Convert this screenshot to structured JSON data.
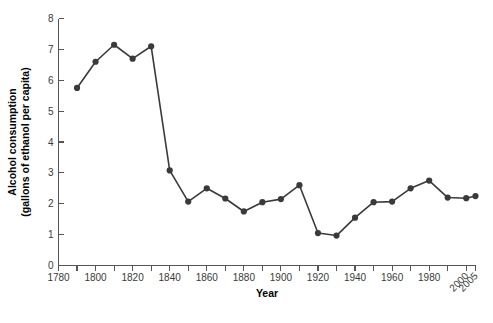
{
  "chart_data": {
    "type": "line",
    "title": "",
    "xlabel": "Year",
    "ylabel": "Alcohol consumption\n(gallons of ethanol per capita)",
    "ylabel_line1": "Alcohol consumption",
    "ylabel_line2": "(gallons of ethanol per capita)",
    "xlim": [
      1780,
      2005
    ],
    "ylim": [
      0,
      8
    ],
    "grid": false,
    "legend": "none",
    "series_color": "#3a3a3a",
    "axis_color": "#555555",
    "x_tick_labels": [
      "1780",
      "1800",
      "1820",
      "1840",
      "1860",
      "1880",
      "1900",
      "1920",
      "1940",
      "1960",
      "1980",
      "2000",
      "2005"
    ],
    "x_tick_values": [
      1780,
      1800,
      1820,
      1840,
      1860,
      1880,
      1900,
      1920,
      1940,
      1960,
      1980,
      2000,
      2005
    ],
    "x_rotated_labels": [
      "2000",
      "2005"
    ],
    "x_minor_ticks": [
      1790,
      1810,
      1830,
      1850,
      1870,
      1890,
      1910,
      1930,
      1950,
      1970,
      1990
    ],
    "y_tick_labels": [
      "0",
      "1",
      "2",
      "3",
      "4",
      "5",
      "6",
      "7",
      "8"
    ],
    "y_tick_values": [
      0,
      1,
      2,
      3,
      4,
      5,
      6,
      7,
      8
    ],
    "x": [
      1790,
      1800,
      1810,
      1820,
      1830,
      1840,
      1850,
      1860,
      1870,
      1880,
      1890,
      1900,
      1910,
      1920,
      1930,
      1940,
      1950,
      1960,
      1970,
      1980,
      1990,
      2000,
      2005
    ],
    "values": [
      5.75,
      6.6,
      7.15,
      6.7,
      7.1,
      3.08,
      2.07,
      2.5,
      2.17,
      1.75,
      2.05,
      2.15,
      2.6,
      1.05,
      0.97,
      1.55,
      2.05,
      2.07,
      2.5,
      2.75,
      2.2,
      2.18,
      2.25
    ],
    "series": [
      {
        "name": "Alcohol consumption",
        "points": [
          {
            "x": 1790,
            "y": 5.75
          },
          {
            "x": 1800,
            "y": 6.6
          },
          {
            "x": 1810,
            "y": 7.15
          },
          {
            "x": 1820,
            "y": 6.7
          },
          {
            "x": 1830,
            "y": 7.1
          },
          {
            "x": 1840,
            "y": 3.08
          },
          {
            "x": 1850,
            "y": 2.07
          },
          {
            "x": 1860,
            "y": 2.5
          },
          {
            "x": 1870,
            "y": 2.17
          },
          {
            "x": 1880,
            "y": 1.75
          },
          {
            "x": 1890,
            "y": 2.05
          },
          {
            "x": 1900,
            "y": 2.15
          },
          {
            "x": 1910,
            "y": 2.6
          },
          {
            "x": 1920,
            "y": 1.05
          },
          {
            "x": 1930,
            "y": 0.97
          },
          {
            "x": 1940,
            "y": 1.55
          },
          {
            "x": 1950,
            "y": 2.05
          },
          {
            "x": 1960,
            "y": 2.07
          },
          {
            "x": 1970,
            "y": 2.5
          },
          {
            "x": 1980,
            "y": 2.75
          },
          {
            "x": 1990,
            "y": 2.2
          },
          {
            "x": 2000,
            "y": 2.18
          },
          {
            "x": 2005,
            "y": 2.25
          }
        ]
      }
    ]
  }
}
